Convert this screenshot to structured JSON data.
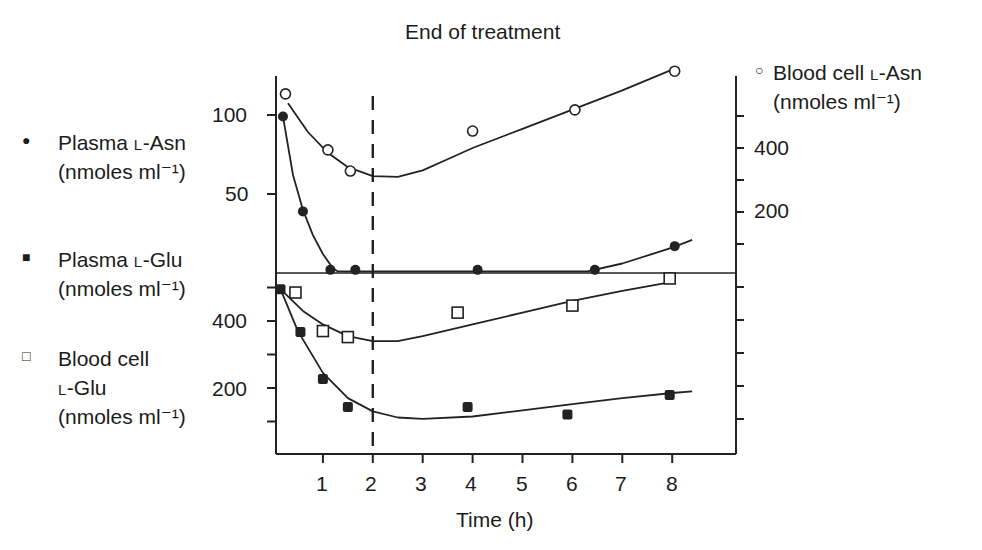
{
  "title": "End of treatment",
  "legend": {
    "plasma_asn": {
      "symbol": "filled-circle",
      "line1_a": "Plasma ",
      "line1_sc": "L",
      "line1_b": "-Asn",
      "line2": "(nmoles ml⁻¹)"
    },
    "plasma_glu": {
      "symbol": "filled-square",
      "line1_a": "Plasma ",
      "line1_sc": "L",
      "line1_b": "-Glu",
      "line2": "(nmoles ml⁻¹)"
    },
    "blood_glu": {
      "symbol": "open-square",
      "line1": "Blood cell",
      "line2_sc": "L",
      "line2_b": "-Glu",
      "line3": "(nmoles ml⁻¹)"
    },
    "blood_asn": {
      "symbol": "open-circle",
      "line1_a": "Blood cell ",
      "line1_sc": "L",
      "line1_b": "-Asn",
      "line2": "(nmoles ml⁻¹)"
    }
  },
  "axes": {
    "upper_left_ticks": [
      "100",
      "50"
    ],
    "lower_left_ticks": [
      "400",
      "200"
    ],
    "upper_right_ticks": [
      "400",
      "200"
    ],
    "x_ticks": [
      "1",
      "2",
      "3",
      "4",
      "5",
      "6",
      "7",
      "8"
    ],
    "xlabel": "Time (h)"
  },
  "chart_data": {
    "type": "scatter",
    "title": "End of treatment",
    "xlabel": "Time (h)",
    "xlim": [
      0,
      9
    ],
    "x_ticks": [
      1,
      2,
      3,
      4,
      5,
      6,
      7,
      8
    ],
    "annotations": [
      {
        "type": "vertical-dashed-line",
        "x": 2,
        "label": "End of treatment"
      }
    ],
    "panels": [
      {
        "name": "upper",
        "left_axis": {
          "label": "Plasma L-Asn (nmoles ml-1)",
          "ylim": [
            0,
            120
          ],
          "ticks": [
            50,
            100
          ]
        },
        "right_axis": {
          "label": "Blood cell L-Asn (nmoles ml-1)",
          "ylim": [
            0,
            600
          ],
          "ticks": [
            100,
            200,
            300,
            400,
            500
          ],
          "labeled_ticks": [
            200,
            400
          ]
        },
        "series": [
          {
            "name": "Plasma L-Asn",
            "axis": "left",
            "marker": "filled-circle",
            "x": [
              0.2,
              0.6,
              1.15,
              1.65,
              4.1,
              6.45,
              8.05
            ],
            "y": [
              99,
              39,
              2,
              2,
              2,
              2,
              17
            ],
            "fit": [
              [
                0.2,
                99
              ],
              [
                0.4,
                62
              ],
              [
                0.6,
                40
              ],
              [
                0.8,
                24
              ],
              [
                1.0,
                12
              ],
              [
                1.2,
                3
              ],
              [
                1.3,
                1
              ],
              [
                6.3,
                1
              ],
              [
                7,
                6
              ],
              [
                8,
                16
              ],
              [
                8.4,
                21
              ]
            ]
          },
          {
            "name": "Blood cell L-Asn",
            "axis": "right",
            "marker": "open-circle",
            "x": [
              0.25,
              1.1,
              1.55,
              4.0,
              6.05,
              8.05
            ],
            "y": [
              569,
              394,
              328,
              453,
              519,
              640
            ],
            "fit": [
              [
                0.3,
                540
              ],
              [
                0.7,
                450
              ],
              [
                1.1,
                385
              ],
              [
                1.5,
                340
              ],
              [
                2.0,
                312
              ],
              [
                2.5,
                310
              ],
              [
                3.0,
                330
              ],
              [
                3.5,
                365
              ],
              [
                4.0,
                400
              ],
              [
                5.0,
                460
              ],
              [
                6.0,
                520
              ],
              [
                7.0,
                580
              ],
              [
                8.0,
                645
              ]
            ]
          }
        ]
      },
      {
        "name": "lower",
        "left_axis": {
          "label": "Plasma L-Glu / Blood cell L-Glu (nmoles ml-1)",
          "ylim": [
            0,
            520
          ],
          "ticks": [
            100,
            200,
            300,
            400,
            500
          ],
          "labeled_ticks": [
            200,
            400
          ]
        },
        "right_axis": {
          "ticks": 5,
          "labeled_ticks": []
        },
        "series": [
          {
            "name": "Plasma L-Glu",
            "axis": "left",
            "marker": "filled-square",
            "x": [
              0.15,
              0.55,
              1.0,
              1.5,
              3.9,
              5.9,
              7.95
            ],
            "y": [
              495,
              367,
              227,
              143,
              143,
              121,
              179
            ],
            "fit": [
              [
                0.15,
                495
              ],
              [
                0.5,
                370
              ],
              [
                1.0,
                245
              ],
              [
                1.5,
                170
              ],
              [
                2.0,
                130
              ],
              [
                2.5,
                112
              ],
              [
                3.0,
                108
              ],
              [
                4.0,
                115
              ],
              [
                5.0,
                133
              ],
              [
                6.0,
                152
              ],
              [
                7.0,
                170
              ],
              [
                8.0,
                185
              ],
              [
                8.4,
                190
              ]
            ]
          },
          {
            "name": "Blood cell L-Glu",
            "axis": "left",
            "marker": "open-square",
            "x": [
              0.45,
              1.0,
              1.5,
              3.7,
              6.0,
              7.95
            ],
            "y": [
              485,
              370,
              352,
              425,
              446,
              527
            ],
            "fit": [
              [
                0.15,
                495
              ],
              [
                0.6,
                430
              ],
              [
                1.0,
                390
              ],
              [
                1.5,
                355
              ],
              [
                2.0,
                340
              ],
              [
                2.5,
                340
              ],
              [
                3.0,
                355
              ],
              [
                4.0,
                390
              ],
              [
                5.0,
                425
              ],
              [
                6.0,
                460
              ],
              [
                7.0,
                490
              ],
              [
                8.0,
                517
              ]
            ]
          }
        ]
      }
    ]
  }
}
